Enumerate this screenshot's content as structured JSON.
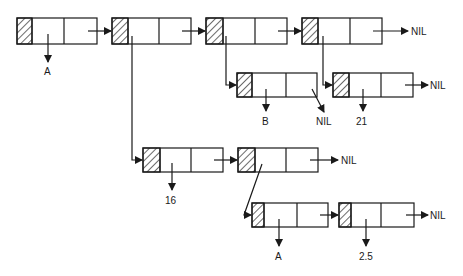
{
  "diagram": {
    "stroke_color": "#1a1a1a",
    "background": "#ffffff",
    "nodes": [
      {
        "id": "n1",
        "x": 17,
        "y": 18,
        "w": 80,
        "h": 26,
        "hatch": 15,
        "div": 64
      },
      {
        "id": "n2",
        "x": 112,
        "y": 18,
        "w": 79,
        "h": 26,
        "hatch": 16,
        "div": 159
      },
      {
        "id": "n3",
        "x": 206,
        "y": 18,
        "w": 81,
        "h": 26,
        "hatch": 17,
        "div": 255
      },
      {
        "id": "n4",
        "x": 302,
        "y": 18,
        "w": 80,
        "h": 26,
        "hatch": 16,
        "div": 350
      },
      {
        "id": "n5",
        "x": 237,
        "y": 73,
        "w": 80,
        "h": 24,
        "hatch": 15,
        "div": 286
      },
      {
        "id": "n6",
        "x": 333,
        "y": 73,
        "w": 80,
        "h": 24,
        "hatch": 16,
        "div": 381
      },
      {
        "id": "n7",
        "x": 143,
        "y": 148,
        "w": 80,
        "h": 24,
        "hatch": 17,
        "div": 191
      },
      {
        "id": "n8",
        "x": 238,
        "y": 148,
        "w": 80,
        "h": 24,
        "hatch": 17,
        "div": 286
      },
      {
        "id": "n9",
        "x": 252,
        "y": 203,
        "w": 76,
        "h": 24,
        "hatch": 12,
        "div": 297
      },
      {
        "id": "n10",
        "x": 339,
        "y": 203,
        "w": 75,
        "h": 24,
        "hatch": 12,
        "div": 381
      }
    ],
    "labels": {
      "n1_value": "A",
      "n4_next": "NIL",
      "n5_value": "B",
      "n5_next": "NIL",
      "n6_value": "21",
      "n6_next": "NIL",
      "n7_value": "16",
      "n8_next": "NIL",
      "n9_value": "A",
      "n10_value": "2.5",
      "n10_next": "NIL"
    }
  }
}
